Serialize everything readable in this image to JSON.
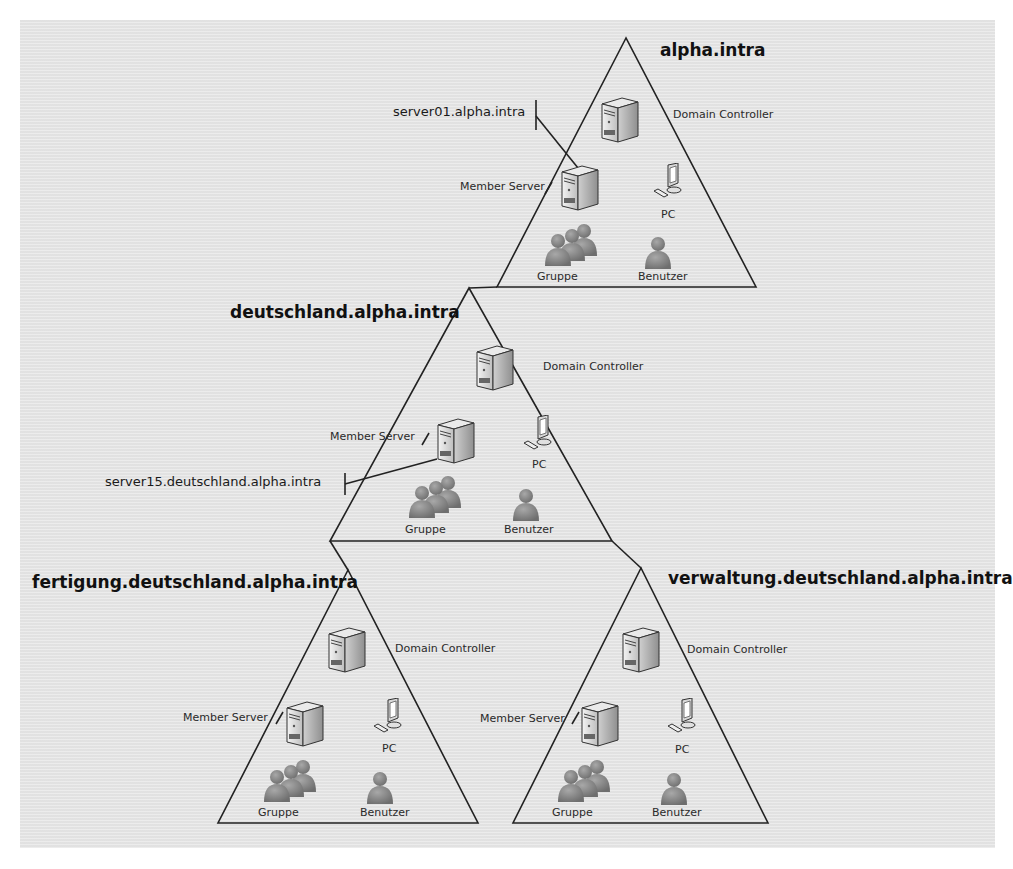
{
  "domains": [
    {
      "id": "root",
      "title": "alpha.intra",
      "roles": {
        "domain_controller": "Domain Controller",
        "member_server": "Member Server",
        "pc": "PC",
        "group": "Gruppe",
        "user": "Benutzer"
      },
      "callout": "server01.alpha.intra"
    },
    {
      "id": "child",
      "title": "deutschland.alpha.intra",
      "roles": {
        "domain_controller": "Domain Controller",
        "member_server": "Member Server",
        "pc": "PC",
        "group": "Gruppe",
        "user": "Benutzer"
      },
      "callout": "server15.deutschland.alpha.intra"
    },
    {
      "id": "grandchild-left",
      "title": "fertigung.deutschland.alpha.intra",
      "roles": {
        "domain_controller": "Domain Controller",
        "member_server": "Member Server",
        "pc": "PC",
        "group": "Gruppe",
        "user": "Benutzer"
      }
    },
    {
      "id": "grandchild-right",
      "title": "verwaltung.deutschland.alpha.intra",
      "roles": {
        "domain_controller": "Domain Controller",
        "member_server": "Member Server",
        "pc": "PC",
        "group": "Gruppe",
        "user": "Benutzer"
      }
    }
  ],
  "icons": {
    "server": "server-tower-icon",
    "pc": "desktop-pc-icon",
    "group": "user-group-icon",
    "user": "single-user-icon"
  },
  "colors": {
    "background": "#e6e6e6",
    "line": "#222222",
    "person": "#8a8a8a"
  }
}
